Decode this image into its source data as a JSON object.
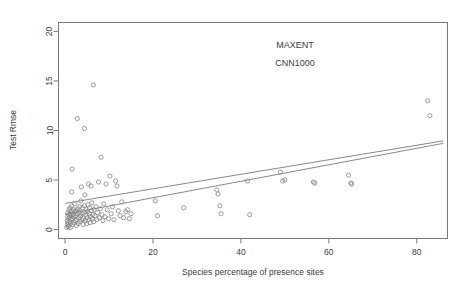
{
  "chart_data": {
    "type": "scatter",
    "title": "",
    "annotations": [
      "MAXENT",
      "CNN1000"
    ],
    "xlabel": "Species percentage of presence sites",
    "ylabel": "Test Rmse",
    "xlim": [
      -1.5,
      87.0
    ],
    "ylim": [
      -0.9,
      20.9
    ],
    "xticks": [
      0,
      20,
      40,
      60,
      80
    ],
    "yticks": [
      0,
      5,
      10,
      15,
      20
    ],
    "xtick_labels": [
      "0",
      "20",
      "40",
      "60",
      "80"
    ],
    "ytick_labels": [
      "0",
      "5",
      "10",
      "15",
      "20"
    ],
    "grid": false,
    "legend": "none",
    "marker": "open-circle",
    "marker_color": "#8a8a8a",
    "line_color": "#7a7a7a",
    "frame_color": "#7a7a7a",
    "points": [
      [
        0.4,
        0.2
      ],
      [
        0.5,
        0.5
      ],
      [
        0.5,
        0.9
      ],
      [
        0.6,
        1.3
      ],
      [
        0.6,
        1.7
      ],
      [
        0.7,
        0.3
      ],
      [
        0.7,
        0.7
      ],
      [
        0.8,
        1.1
      ],
      [
        0.8,
        1.5
      ],
      [
        0.9,
        2.0
      ],
      [
        0.9,
        0.4
      ],
      [
        1.0,
        0.8
      ],
      [
        1.0,
        1.2
      ],
      [
        1.1,
        1.6
      ],
      [
        1.1,
        2.2
      ],
      [
        1.2,
        0.2
      ],
      [
        1.2,
        0.6
      ],
      [
        1.3,
        1.0
      ],
      [
        1.3,
        1.4
      ],
      [
        1.4,
        1.9
      ],
      [
        1.5,
        2.4
      ],
      [
        1.5,
        3.8
      ],
      [
        1.6,
        6.1
      ],
      [
        1.7,
        0.5
      ],
      [
        1.7,
        1.1
      ],
      [
        1.8,
        1.5
      ],
      [
        1.9,
        2.0
      ],
      [
        2.0,
        0.7
      ],
      [
        2.0,
        1.3
      ],
      [
        2.1,
        1.8
      ],
      [
        2.2,
        2.6
      ],
      [
        2.3,
        0.9
      ],
      [
        2.4,
        1.4
      ],
      [
        2.5,
        1.9
      ],
      [
        2.6,
        0.4
      ],
      [
        2.7,
        1.0
      ],
      [
        2.8,
        1.6
      ],
      [
        2.9,
        2.1
      ],
      [
        3.0,
        0.6
      ],
      [
        3.1,
        1.2
      ],
      [
        3.2,
        1.8
      ],
      [
        3.3,
        2.3
      ],
      [
        3.4,
        0.8
      ],
      [
        3.5,
        1.4
      ],
      [
        3.6,
        2.9
      ],
      [
        3.7,
        4.3
      ],
      [
        3.8,
        1.0
      ],
      [
        3.9,
        1.6
      ],
      [
        4.0,
        2.2
      ],
      [
        4.1,
        0.5
      ],
      [
        4.2,
        1.1
      ],
      [
        4.3,
        1.7
      ],
      [
        4.4,
        2.4
      ],
      [
        4.5,
        3.5
      ],
      [
        4.6,
        0.9
      ],
      [
        4.7,
        1.5
      ],
      [
        4.8,
        2.0
      ],
      [
        4.9,
        0.6
      ],
      [
        5.0,
        1.2
      ],
      [
        5.1,
        1.8
      ],
      [
        5.2,
        2.5
      ],
      [
        5.3,
        4.6
      ],
      [
        5.4,
        1.0
      ],
      [
        5.5,
        1.6
      ],
      [
        5.6,
        2.2
      ],
      [
        5.7,
        0.7
      ],
      [
        5.8,
        1.3
      ],
      [
        5.9,
        4.4
      ],
      [
        6.0,
        1.9
      ],
      [
        6.1,
        2.7
      ],
      [
        6.2,
        1.1
      ],
      [
        6.3,
        1.5
      ],
      [
        6.4,
        14.6
      ],
      [
        6.5,
        0.8
      ],
      [
        6.6,
        2.0
      ],
      [
        6.8,
        1.4
      ],
      [
        7.0,
        2.3
      ],
      [
        7.2,
        1.0
      ],
      [
        7.4,
        1.7
      ],
      [
        7.6,
        4.8
      ],
      [
        7.8,
        1.2
      ],
      [
        8.0,
        2.1
      ],
      [
        8.2,
        7.3
      ],
      [
        8.4,
        1.5
      ],
      [
        8.6,
        0.9
      ],
      [
        8.8,
        2.6
      ],
      [
        9.0,
        1.3
      ],
      [
        9.3,
        4.6
      ],
      [
        9.6,
        2.0
      ],
      [
        9.9,
        1.1
      ],
      [
        10.2,
        5.4
      ],
      [
        10.5,
        1.6
      ],
      [
        10.8,
        2.3
      ],
      [
        11.1,
        1.0
      ],
      [
        11.5,
        4.9
      ],
      [
        11.8,
        4.4
      ],
      [
        12.1,
        1.9
      ],
      [
        12.5,
        1.4
      ],
      [
        12.9,
        2.8
      ],
      [
        13.3,
        1.2
      ],
      [
        13.8,
        1.8
      ],
      [
        14.2,
        2.0
      ],
      [
        14.6,
        1.1
      ],
      [
        15.0,
        1.6
      ],
      [
        2.8,
        11.2
      ],
      [
        4.4,
        10.2
      ],
      [
        20.5,
        2.9
      ],
      [
        21.0,
        1.4
      ],
      [
        27.0,
        2.2
      ],
      [
        34.5,
        4.0
      ],
      [
        34.8,
        3.6
      ],
      [
        35.2,
        2.4
      ],
      [
        35.5,
        1.6
      ],
      [
        41.5,
        4.9
      ],
      [
        42.0,
        1.5
      ],
      [
        49.0,
        5.8
      ],
      [
        49.5,
        4.9
      ],
      [
        50.0,
        5.0
      ],
      [
        56.5,
        4.8
      ],
      [
        56.8,
        4.7
      ],
      [
        64.5,
        5.5
      ],
      [
        65.0,
        4.7
      ],
      [
        65.2,
        4.6
      ],
      [
        82.5,
        13.0
      ],
      [
        83.0,
        11.5
      ]
    ],
    "lines": [
      {
        "name": "fit-line-upper",
        "x0": 0.0,
        "y0": 2.65,
        "x1": 86.0,
        "y1": 8.95
      },
      {
        "name": "fit-line-lower",
        "x0": 0.0,
        "y0": 1.55,
        "x1": 86.0,
        "y1": 8.7
      }
    ]
  }
}
